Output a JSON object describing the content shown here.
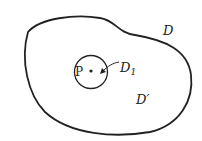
{
  "diagram": {
    "regions": {
      "outer_label": "D",
      "inner_label": "D",
      "inner_subscript": "1",
      "complement_label": "D′"
    },
    "point": {
      "label": "P"
    },
    "colors": {
      "stroke": "#222222",
      "background": "#ffffff"
    }
  }
}
